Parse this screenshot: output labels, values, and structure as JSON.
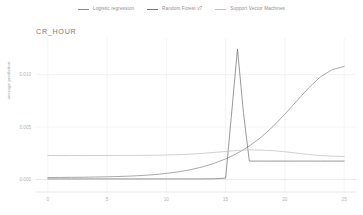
{
  "title": "CR_HOUR",
  "legend": {
    "position": "top-center",
    "items": [
      {
        "label": "Logistic regression",
        "color": "#8c8c8c"
      },
      {
        "label": "Random Forest v7",
        "color": "#777777"
      },
      {
        "label": "Support Vector Machines",
        "color": "#c2c2c2"
      }
    ]
  },
  "axes": {
    "ylabel": "average prediction",
    "xlabel": "",
    "x_ticks": [
      "0",
      "5",
      "10",
      "15",
      "20",
      "25"
    ],
    "y_ticks": [
      "0.000",
      "0.005",
      "0.010"
    ]
  },
  "chart_data": {
    "type": "line",
    "title": "CR_HOUR",
    "xlabel": "",
    "ylabel": "average prediction",
    "xlim": [
      -1,
      26
    ],
    "ylim": [
      -0.0012,
      0.0133
    ],
    "grid": true,
    "legend_position": "top-center",
    "x_ticks": [
      0,
      5,
      10,
      15,
      20,
      25
    ],
    "y_ticks": [
      0.0,
      0.005,
      0.01
    ],
    "x": [
      0,
      1,
      2,
      3,
      4,
      5,
      6,
      7,
      8,
      9,
      10,
      11,
      12,
      13,
      14,
      15,
      15.5,
      16,
      16.5,
      17,
      18,
      19,
      20,
      21,
      22,
      23,
      24,
      25
    ],
    "series": [
      {
        "name": "Logistic regression",
        "color": "#8c8c8c",
        "values": [
          0.00018,
          0.00019,
          0.0002,
          0.00021,
          0.00023,
          0.00025,
          0.00028,
          0.00032,
          0.00038,
          0.00046,
          0.00057,
          0.00072,
          0.00092,
          0.00118,
          0.00152,
          0.00196,
          0.00222,
          0.00251,
          0.00283,
          0.00319,
          0.00403,
          0.00505,
          0.00622,
          0.00748,
          0.00872,
          0.00979,
          0.01048,
          0.01078
        ]
      },
      {
        "name": "Random Forest v7",
        "color": "#777777",
        "values": [
          5e-05,
          5e-05,
          5e-05,
          5e-05,
          5e-05,
          5e-05,
          5e-05,
          5e-05,
          5e-05,
          5e-05,
          5e-05,
          5e-05,
          5e-05,
          5e-05,
          6e-05,
          0.00012,
          0.00625,
          0.01245,
          0.0064,
          0.00175,
          0.00175,
          0.00175,
          0.00175,
          0.00175,
          0.00175,
          0.00175,
          0.00175,
          0.00175
        ]
      },
      {
        "name": "Support Vector Machines",
        "color": "#c2c2c2",
        "values": [
          0.00228,
          0.00228,
          0.00228,
          0.00228,
          0.00228,
          0.00228,
          0.00229,
          0.00229,
          0.0023,
          0.00231,
          0.00233,
          0.00236,
          0.00241,
          0.00248,
          0.00257,
          0.00267,
          0.00272,
          0.00276,
          0.00279,
          0.00281,
          0.0028,
          0.00274,
          0.00264,
          0.00251,
          0.00238,
          0.00228,
          0.00222,
          0.00219
        ]
      }
    ]
  }
}
